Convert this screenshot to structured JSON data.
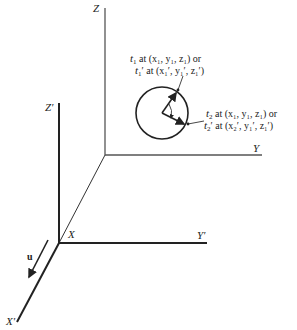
{
  "figure": {
    "axes_primary": {
      "z_label": "Z",
      "y_label": "Y",
      "x_label": "X"
    },
    "axes_moving": {
      "z_label": "Z′",
      "y_label": "Y′",
      "x_label": "X′"
    },
    "velocity_label": "u",
    "annotation_t1": {
      "line1_t": "t",
      "line1_sub": "1",
      "line1_rest": " at (x₁, y₁, z₁)  or",
      "line2_t": "t",
      "line2_sub": "1",
      "line2_rest": "′ at (x₁′, y₁′, z₁′)"
    },
    "annotation_t2": {
      "line1_t": "t",
      "line1_sub": "2",
      "line1_rest": " at (x₁, y₁, z₁) or",
      "line2_t": "t",
      "line2_sub": "2",
      "line2_rest": "′ at (x₂′, y₁′, z₁′)"
    }
  }
}
